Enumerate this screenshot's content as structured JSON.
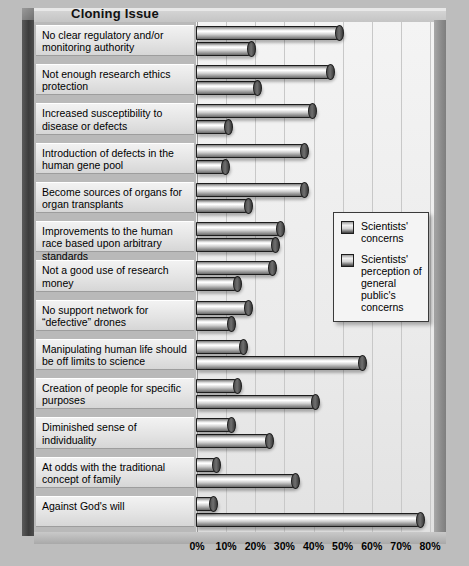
{
  "title": "Cloning Issue",
  "legend": {
    "items": [
      {
        "label": "Scientists' concerns",
        "swatch": "legend-swatch-scientists"
      },
      {
        "label": "Scientists' perception of general public's concerns",
        "swatch": "legend-swatch-public"
      }
    ]
  },
  "axis": {
    "ticks": [
      "0%",
      "10%",
      "20%",
      "30%",
      "40%",
      "50%",
      "60%",
      "70%",
      "80%"
    ]
  },
  "chart_data": {
    "type": "bar",
    "orientation": "horizontal",
    "title": "Cloning Issue",
    "xlabel": "",
    "ylabel": "Cloning Issue",
    "xlim": [
      0,
      80
    ],
    "grid": true,
    "legend_position": "middle-right",
    "tick_labels": [
      "0%",
      "10%",
      "20%",
      "30%",
      "40%",
      "50%",
      "60%",
      "70%",
      "80%"
    ],
    "categories": [
      "No clear regulatory and/or monitoring authority",
      "Not enough research ethics protection",
      "Increased susceptibility to disease or defects",
      "Introduction of defects in the human gene pool",
      "Become sources of organs for organ transplants",
      "Improvements to the human race based upon arbitrary standards",
      "Not a good use of research money",
      "No support network for “defective” drones",
      "Manipulating human life should be off limits to science",
      "Creation of people for specific purposes",
      "Diminished sense of individuality",
      "At odds with the traditional concept of family",
      "Against God's will"
    ],
    "series": [
      {
        "name": "Scientists' concerns",
        "values": [
          50,
          47,
          41,
          38,
          38,
          30,
          27,
          19,
          17,
          15,
          13,
          8,
          7
        ]
      },
      {
        "name": "Scientists' perception of general public's concerns",
        "values": [
          20,
          22,
          12,
          11,
          19,
          28,
          15,
          13,
          58,
          42,
          26,
          35,
          78
        ]
      }
    ]
  }
}
